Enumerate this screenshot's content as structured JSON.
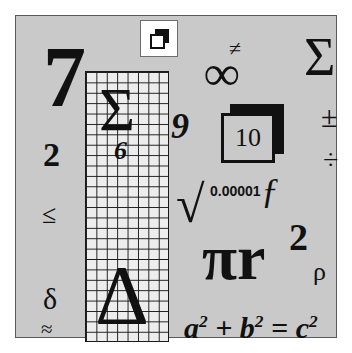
{
  "panel": {
    "background_color": "#c9c9c9",
    "border_color": "#5a5a5a"
  },
  "grid": {
    "name": "graph-paper",
    "background_color": "#ededed",
    "line_color": "#1a1a1a",
    "cell_size_px": 10,
    "columns": 8,
    "rows": 26
  },
  "symbols": {
    "seven": "7",
    "two": "2",
    "leq": "≤",
    "delta": "δ",
    "approx": "≈",
    "sigma_grid": "Σ",
    "six": "6",
    "triangle": "Δ",
    "nine": "9",
    "not_equal": "≠",
    "infinity": "∞",
    "sigma_big": "Σ",
    "plus_minus": "±",
    "divide": "÷",
    "square_root": "√",
    "small_number": "0.00001",
    "function_f": "ƒ",
    "pi_r": "πr",
    "pi_r_exponent": "2",
    "rho": "ρ",
    "pythagoras_a": "a",
    "pythagoras_plus": "+",
    "pythagoras_b": "b",
    "pythagoras_equals": "=",
    "pythagoras_c": "c",
    "exponent_two": "2"
  },
  "boxed_value": {
    "label": "10"
  },
  "icon_tile": {
    "name": "copy-overlap-icon",
    "background_color": "#ffffff",
    "glyph_color": "#111111"
  },
  "colors": {
    "ink": "#111111",
    "panel": "#c9c9c9",
    "grid_fill": "#ededed",
    "white": "#ffffff"
  }
}
